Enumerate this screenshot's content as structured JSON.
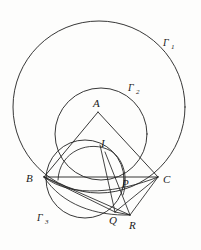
{
  "figure": {
    "kind": "geometry-diagram",
    "background_color": "#fdfdfc",
    "ink_color": "#202020",
    "width": 201,
    "height": 250
  },
  "labels": {
    "A": "A",
    "B": "B",
    "C": "C",
    "I": "I",
    "P": "P",
    "Q": "Q",
    "R": "R",
    "gamma": "Γ",
    "gamma1_sub": "1",
    "gamma2_sub": "2",
    "gamma3_sub": "3"
  },
  "points": [
    {
      "name": "A",
      "label": "A",
      "x": 98,
      "y": 112,
      "label_x": 93,
      "label_y": 107
    },
    {
      "name": "B",
      "label": "B",
      "x": 44,
      "y": 177,
      "label_x": 28,
      "label_y": 182
    },
    {
      "name": "C",
      "label": "C",
      "x": 158,
      "y": 177,
      "label_x": 164,
      "label_y": 183
    },
    {
      "name": "I",
      "label": "I",
      "x": 105,
      "y": 152,
      "label_x": 101,
      "label_y": 147
    },
    {
      "name": "P",
      "label": "P",
      "x": 126,
      "y": 180,
      "label_x": 124,
      "label_y": 186
    },
    {
      "name": "Q",
      "label": "Q",
      "x": 115,
      "y": 212,
      "label_x": 110,
      "label_y": 223
    },
    {
      "name": "R",
      "label": "R",
      "x": 130,
      "y": 215,
      "label_x": 131,
      "label_y": 228
    }
  ],
  "circles": [
    {
      "name": "gamma-1",
      "label": "Γ1",
      "cx": 99,
      "cy": 107,
      "r": 86,
      "label_x": 167,
      "label_y": 44
    },
    {
      "name": "gamma-2",
      "label": "Γ2",
      "cx": 101,
      "cy": 134,
      "r": 46,
      "label_x": 132,
      "label_y": 89
    },
    {
      "name": "gamma-3",
      "label": "Γ3",
      "cx": 85,
      "cy": 179,
      "r": 39,
      "label_x": 41,
      "label_y": 220
    }
  ],
  "segments": [
    {
      "name": "side-AB",
      "from": "A",
      "to": "B"
    },
    {
      "name": "side-AC",
      "from": "A",
      "to": "C"
    },
    {
      "name": "side-BC",
      "from": "B",
      "to": "C"
    },
    {
      "name": "line-B-to-R",
      "from": "B",
      "to": "R"
    },
    {
      "name": "line-B-to-Q",
      "from": "B",
      "to": "Q"
    },
    {
      "name": "line-C-to-Q",
      "from": "C",
      "to": "Q"
    },
    {
      "name": "line-Q-to-R",
      "from": "Q",
      "to": "R"
    },
    {
      "name": "line-C-to-R",
      "from": "C",
      "to": "R"
    },
    {
      "name": "line-I-to-Q",
      "from": "I",
      "to": "Q"
    },
    {
      "name": "line-A-to-R",
      "from": "A",
      "to": "R"
    }
  ],
  "arcs": [
    {
      "name": "incircle-arc-through-I",
      "d": "M 60 182 C 62 150 92 140 112 152 C 124 160 126 178 122 192"
    },
    {
      "name": "arc-B-through-P-to-C",
      "d": "M 44 177 C 70 196 116 190 158 177"
    }
  ]
}
